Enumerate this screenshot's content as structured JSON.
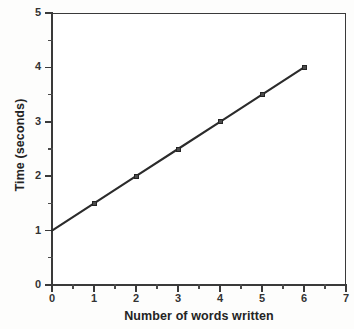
{
  "chart_data": {
    "type": "line",
    "title": "",
    "subtitle": "",
    "xlabel": "Number of words written",
    "ylabel": "Time (seconds)",
    "xlim": [
      0,
      7
    ],
    "ylim": [
      0,
      5
    ],
    "xticks": [
      "0",
      "1",
      "2",
      "3",
      "4",
      "5",
      "6",
      "7"
    ],
    "xtick_values": [
      0,
      1,
      2,
      3,
      4,
      5,
      6,
      7
    ],
    "xminor_ticks": [
      0.5,
      1.5,
      2.5,
      3.5,
      4.5,
      5.5,
      6.5
    ],
    "yticks": [
      "0",
      "1",
      "2",
      "3",
      "4",
      "5"
    ],
    "ytick_values": [
      0,
      1,
      2,
      3,
      4,
      5
    ],
    "yminor_ticks": [
      0.5,
      1.5,
      2.5,
      3.5,
      4.5
    ],
    "grid": false,
    "legend": false,
    "legend_position": "none",
    "frame": true,
    "series": [
      {
        "name": "Time vs words",
        "marker": "square",
        "line_color": "#2b2b2b",
        "marker_color": "#4b4b4b",
        "x": [
          0,
          1,
          2,
          3,
          4,
          5,
          6
        ],
        "y": [
          1.0,
          1.5,
          2.0,
          2.5,
          3.0,
          3.5,
          4.0
        ],
        "points": [
          {
            "x": 0,
            "y": 1.0,
            "marker_visible": false
          },
          {
            "x": 1,
            "y": 1.5,
            "marker_visible": true
          },
          {
            "x": 2,
            "y": 2.0,
            "marker_visible": true
          },
          {
            "x": 3,
            "y": 2.5,
            "marker_visible": true
          },
          {
            "x": 4,
            "y": 3.0,
            "marker_visible": true
          },
          {
            "x": 5,
            "y": 3.5,
            "marker_visible": true
          },
          {
            "x": 6,
            "y": 4.0,
            "marker_visible": true
          }
        ]
      }
    ],
    "annotations": []
  },
  "colors": {
    "ink": "#2b2b2b",
    "axis": "#3a3a3a",
    "text": "#242424",
    "background": "#fdfdfc",
    "plot_background": "#ffffff"
  }
}
